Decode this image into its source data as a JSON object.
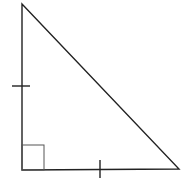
{
  "diagram": {
    "type": "right-isosceles-triangle",
    "width": 187,
    "height": 183,
    "stroke_color": "#222222",
    "right_angle_marker_color": "#555555",
    "vertices": {
      "top": [
        22,
        4
      ],
      "right_angle": [
        22,
        170
      ],
      "bottom_right": [
        179,
        169
      ]
    },
    "right_angle_marker": {
      "x": 22,
      "y": 145,
      "size_w": 22,
      "size_h": 25
    },
    "tick_marks": [
      {
        "side": "vertical-leg",
        "x1": 12,
        "y1": 86,
        "x2": 30,
        "y2": 86
      },
      {
        "side": "horizontal-leg",
        "x1": 100,
        "y1": 160,
        "x2": 100,
        "y2": 178
      }
    ],
    "labels": []
  }
}
